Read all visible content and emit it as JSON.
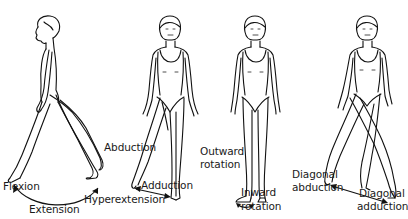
{
  "figure": {
    "panels": [
      {
        "id": "flexion-extension",
        "labels": {
          "flexion": "Flexion",
          "extension": "Extension",
          "hyperextension": "Hyperextension"
        }
      },
      {
        "id": "abduction-adduction",
        "labels": {
          "abduction": "Abduction",
          "adduction": "Adduction"
        }
      },
      {
        "id": "rotation",
        "labels": {
          "outward_line1": "Outward",
          "outward_line2": "rotation",
          "inward_line1": "Inward",
          "inward_line2": "rotation"
        }
      },
      {
        "id": "diagonal",
        "labels": {
          "diag_abduction_line1": "Diagonal",
          "diag_abduction_line2": "abduction",
          "diag_adduction_line1": "Diagonal",
          "diag_adduction_line2": "adduction"
        }
      }
    ]
  }
}
